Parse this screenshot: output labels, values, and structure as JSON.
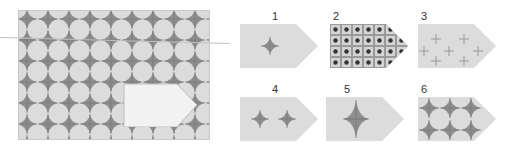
{
  "puzzle": {
    "question_area": "pattern with missing piece",
    "options": [
      {
        "label": "1",
        "content": "single small star"
      },
      {
        "label": "2",
        "content": "grid of dark dots"
      },
      {
        "label": "3",
        "content": "scattered plus signs"
      },
      {
        "label": "4",
        "content": "two stars"
      },
      {
        "label": "5",
        "content": "single large star"
      },
      {
        "label": "6",
        "content": "2x3 star grid"
      }
    ]
  },
  "colors": {
    "bg": "#dcdcdc",
    "star": "#8a8a8a",
    "blank": "#f2f2f2"
  }
}
